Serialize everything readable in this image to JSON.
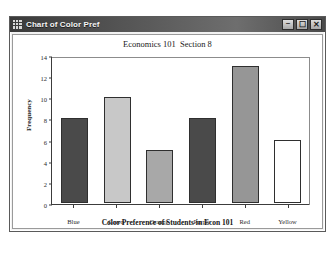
{
  "window": {
    "title": "Chart of Color Pref",
    "icon": "grid-icon",
    "buttons": {
      "minimize": "–",
      "maximize": "☐",
      "close": "✕"
    }
  },
  "chart_data": {
    "type": "bar",
    "title": "Economics 101  Section 8",
    "xlabel": "Color Preference of Students in Econ 101",
    "ylabel": "Frequency",
    "categories": [
      "Blue",
      "Green",
      "Orange",
      "Purple",
      "Red",
      "Yellow"
    ],
    "values": [
      8,
      10,
      5,
      8,
      13,
      6
    ],
    "bar_colors": [
      "#4a4a4a",
      "#c8c8c8",
      "#a8a8a8",
      "#4a4a4a",
      "#969696",
      "#ffffff"
    ],
    "bar_border_color": "#2f2f2f",
    "ylim": [
      0,
      14
    ],
    "yticks": [
      0,
      2,
      4,
      6,
      8,
      10,
      12,
      14
    ],
    "ytick_labels": [
      "0",
      "2",
      "4",
      "6",
      "8",
      "10",
      "12",
      "14"
    ],
    "grid": false,
    "legend": null
  }
}
